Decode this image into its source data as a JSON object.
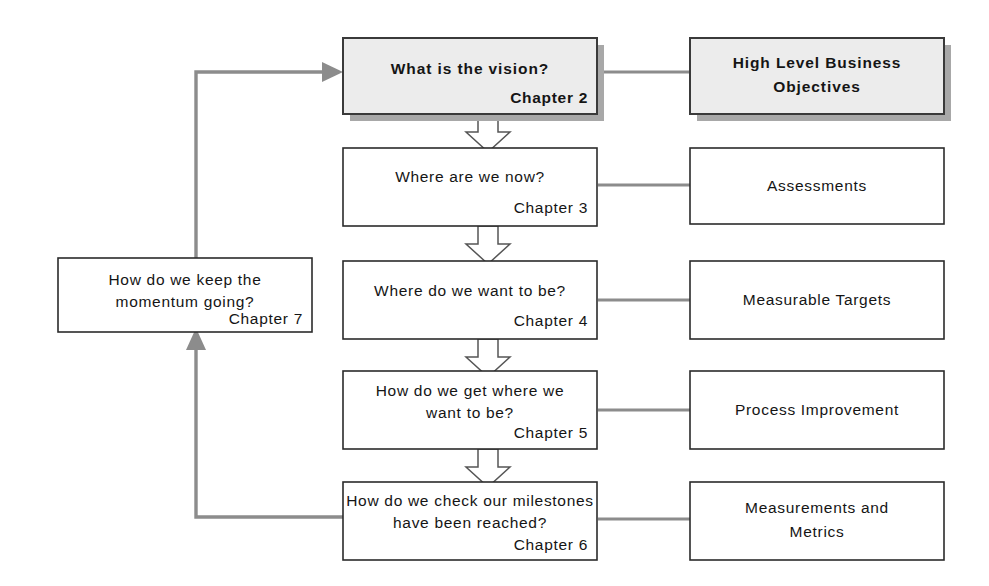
{
  "diagram": {
    "background_color": "#ffffff",
    "line_color": "#8c8c8c",
    "box_border_color": "#2b2b2b",
    "shaded_box_fill": "#ececec",
    "shadow_color": "#a8a8a8"
  },
  "center_column": [
    {
      "id": "vision",
      "question": "What is the vision?",
      "chapter": "Chapter 2",
      "lines": [
        "What is the vision?"
      ],
      "style": "shaded-shadow"
    },
    {
      "id": "where-now",
      "question": "Where are we now?",
      "chapter": "Chapter 3",
      "lines": [
        "Where are we now?"
      ],
      "style": "plain"
    },
    {
      "id": "where-want",
      "question": "Where do we want to be?",
      "chapter": "Chapter 4",
      "lines": [
        "Where do we want to be?"
      ],
      "style": "plain"
    },
    {
      "id": "how-get",
      "question": "How do we get where we want to be?",
      "chapter": "Chapter 5",
      "lines": [
        "How do we get where we",
        "want to be?"
      ],
      "style": "plain"
    },
    {
      "id": "how-check",
      "question": "How do we check our milestones have been reached?",
      "chapter": "Chapter 6",
      "lines": [
        "How do we check our milestones",
        "have been reached?"
      ],
      "style": "plain"
    }
  ],
  "right_column": [
    {
      "id": "objectives",
      "lines": [
        "High Level Business",
        "Objectives"
      ],
      "style": "shaded-shadow"
    },
    {
      "id": "assessments",
      "lines": [
        "Assessments"
      ],
      "style": "plain"
    },
    {
      "id": "targets",
      "lines": [
        "Measurable Targets"
      ],
      "style": "plain"
    },
    {
      "id": "process-improvement",
      "lines": [
        "Process Improvement"
      ],
      "style": "plain"
    },
    {
      "id": "measurements",
      "lines": [
        "Measurements and",
        "Metrics"
      ],
      "style": "plain"
    }
  ],
  "left_column": [
    {
      "id": "momentum",
      "question": "How do we keep the momentum going?",
      "chapter": "Chapter 7",
      "lines": [
        "How do we keep the",
        "momentum going?"
      ],
      "style": "plain"
    }
  ],
  "connectors": {
    "vertical_flow": [
      {
        "from": "vision",
        "to": "where-now",
        "type": "block-arrow-down"
      },
      {
        "from": "where-now",
        "to": "where-want",
        "type": "block-arrow-down"
      },
      {
        "from": "where-want",
        "to": "how-get",
        "type": "block-arrow-down"
      },
      {
        "from": "how-get",
        "to": "how-check",
        "type": "block-arrow-down"
      }
    ],
    "lateral": [
      {
        "from": "vision",
        "to": "objectives",
        "type": "line"
      },
      {
        "from": "where-now",
        "to": "assessments",
        "type": "line"
      },
      {
        "from": "where-want",
        "to": "targets",
        "type": "line"
      },
      {
        "from": "how-get",
        "to": "process-improvement",
        "type": "line"
      },
      {
        "from": "how-check",
        "to": "measurements",
        "type": "line"
      }
    ],
    "feedback": [
      {
        "from": "how-check",
        "to": "momentum",
        "type": "arrow-up"
      },
      {
        "from": "momentum",
        "to": "vision",
        "type": "arrow-right"
      }
    ]
  }
}
